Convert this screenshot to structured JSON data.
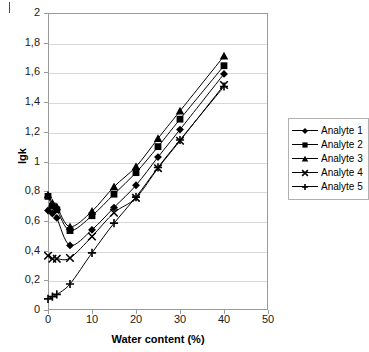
{
  "chart_data": {
    "type": "line",
    "title": "",
    "xlabel": "Water content (%)",
    "ylabel": "lgk",
    "xlim": [
      0,
      50
    ],
    "ylim": [
      0,
      2
    ],
    "grid": "horizontal",
    "legend_position": "right",
    "x_ticks": [
      "0",
      "10",
      "20",
      "30",
      "40",
      "50"
    ],
    "x_tick_values": [
      0,
      10,
      20,
      30,
      40,
      50
    ],
    "y_ticks": [
      "0",
      "0,2",
      "0,4",
      "0,6",
      "0,8",
      "1",
      "1,2",
      "1,4",
      "1,6",
      "1,8",
      "2"
    ],
    "y_tick_values": [
      0,
      0.2,
      0.4,
      0.6,
      0.8,
      1.0,
      1.2,
      1.4,
      1.6,
      1.8,
      2.0
    ],
    "decimal_separator": ",",
    "x": [
      0,
      1,
      2,
      5,
      10,
      15,
      20,
      25,
      30,
      40
    ],
    "series": [
      {
        "name": "Analyte 1",
        "marker": "diamond",
        "color": "#000000",
        "values": [
          0.67,
          0.65,
          0.62,
          0.435,
          0.54,
          0.69,
          0.84,
          1.03,
          1.215,
          1.59
        ]
      },
      {
        "name": "Analyte 2",
        "marker": "square",
        "color": "#000000",
        "values": [
          0.765,
          0.7,
          0.675,
          0.535,
          0.635,
          0.78,
          0.925,
          1.1,
          1.285,
          1.645
        ]
      },
      {
        "name": "Analyte 3",
        "marker": "triangle",
        "color": "#000000",
        "values": [
          0.775,
          0.72,
          0.695,
          0.56,
          0.665,
          0.83,
          0.965,
          1.155,
          1.34,
          1.71
        ]
      },
      {
        "name": "Analyte 4",
        "marker": "cross-x",
        "color": "#000000",
        "values": [
          0.365,
          0.345,
          0.345,
          0.35,
          0.495,
          0.655,
          0.755,
          0.955,
          1.14,
          1.515
        ]
      },
      {
        "name": "Analyte 5",
        "marker": "plus",
        "color": "#000000",
        "values": [
          0.075,
          0.09,
          0.105,
          0.175,
          0.385,
          0.585,
          0.76,
          0.96,
          1.145,
          1.505
        ]
      }
    ]
  }
}
